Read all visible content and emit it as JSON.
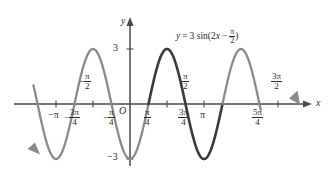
{
  "figure": {
    "title_equation": "y = 3 sin(2x − π/2)",
    "equation_parts": {
      "lhs": "y",
      "equals": "=",
      "amplitude": "3",
      "func": "sin(2",
      "var": "x",
      "minus": "−",
      "phase_num": "π",
      "phase_den": "2",
      "close": ")"
    },
    "axis_labels": {
      "x": "x",
      "y": "y",
      "origin": "O"
    },
    "y_ticks": [
      {
        "label": "3",
        "value": 3
      },
      {
        "label": "−3",
        "value": -3
      }
    ],
    "x_ticks_below": [
      {
        "label": "−π",
        "value": -3.14159
      },
      {
        "label": "−3π/4",
        "num": "3π",
        "den": "4",
        "sign": "−",
        "value": -2.35619
      },
      {
        "label": "−π/4",
        "num": "π",
        "den": "4",
        "sign": "−",
        "value": -0.785398
      },
      {
        "label": "π/4",
        "num": "π",
        "den": "4",
        "sign": "",
        "value": 0.785398
      },
      {
        "label": "3π/4",
        "num": "3π",
        "den": "4",
        "sign": "",
        "value": 2.35619
      },
      {
        "label": "π",
        "value": 3.14159
      },
      {
        "label": "5π/4",
        "num": "5π",
        "den": "4",
        "sign": "",
        "value": 3.92699
      }
    ],
    "x_ticks_above": [
      {
        "label": "−π/2",
        "num": "π",
        "den": "2",
        "sign": "−",
        "value": -1.5708
      },
      {
        "label": "π/2",
        "num": "π",
        "den": "2",
        "sign": "",
        "value": 1.5708
      },
      {
        "label": "3π/2",
        "num": "3π",
        "den": "2",
        "sign": "",
        "value": 4.71239
      }
    ],
    "colors": {
      "axis": "#4a4a4a",
      "curve_main": "#3a3a3a",
      "curve_extension": "#8a8a8a",
      "text": "#2b2b2b"
    }
  },
  "chart_data": {
    "type": "line",
    "xlabel": "x",
    "ylabel": "y",
    "function": "y = 3*sin(2*x - pi/2)",
    "amplitude": 3,
    "period": 3.14159,
    "phase_shift": 0.785398,
    "xlim": [
      -4.2,
      5.65
    ],
    "ylim": [
      -3.9,
      3.9
    ],
    "grid": false,
    "legend": "none",
    "x_tick_values": [
      -3.14159,
      -2.35619,
      -1.5708,
      -0.785398,
      0.785398,
      1.5708,
      2.35619,
      3.14159,
      3.92699,
      4.71239
    ],
    "x_tick_labels": [
      "−π",
      "−3π/4",
      "−π/2",
      "−π/4",
      "π/4",
      "π/2",
      "3π/4",
      "π",
      "5π/4",
      "3π/2"
    ],
    "y_tick_values": [
      3,
      -3
    ],
    "y_tick_labels": [
      "3",
      "−3"
    ],
    "key_points": [
      {
        "x": -1.5708,
        "y": 3,
        "kind": "maximum"
      },
      {
        "x": -0.785398,
        "y": 0,
        "kind": "zero-descending"
      },
      {
        "x": 0,
        "y": -3,
        "kind": "minimum"
      },
      {
        "x": 0.785398,
        "y": 0,
        "kind": "zero-ascending"
      },
      {
        "x": 1.5708,
        "y": 3,
        "kind": "maximum"
      },
      {
        "x": 2.35619,
        "y": 0,
        "kind": "zero-descending"
      },
      {
        "x": 3.14159,
        "y": -3,
        "kind": "minimum"
      },
      {
        "x": 3.92699,
        "y": 0,
        "kind": "zero-ascending"
      },
      {
        "x": 4.71239,
        "y": 3,
        "kind": "maximum"
      }
    ],
    "series": [
      {
        "name": "extension-left",
        "style": "gray",
        "x_range": [
          -4.1,
          0.785398
        ]
      },
      {
        "name": "main-period",
        "style": "dark",
        "x_range": [
          0.785398,
          3.92699
        ]
      },
      {
        "name": "extension-right",
        "style": "gray",
        "x_range": [
          3.92699,
          5.55
        ]
      }
    ],
    "annotations": [
      {
        "text": "y = 3 sin(2x − π/2)",
        "x": 1.6,
        "y": 3.55
      }
    ]
  }
}
